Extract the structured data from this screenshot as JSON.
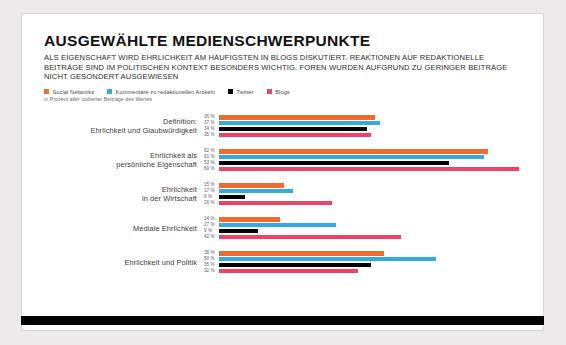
{
  "header": {
    "title": "AUSGEWÄHLTE MEDIENSCHWERPUNKTE",
    "subtitle": "ALS EIGENSCHAFT WIRD EHRLICHKEIT AM HÄUFIGSTEN IN BLOGS DISKUTIERT. REAKTIONEN AUF REDAKTIONELLE BEITRÄGE SIND IM POLITISCHEN KONTEXT BESONDERS WICHTIG. FOREN WURDEN AUFGRUND ZU GERINGER BEITRÄGE NICHT GESONDERT AUSGEWIESEN",
    "legend_note": "in Prozent aller codierter Beiträge des Wertes"
  },
  "colors": {
    "social_networks": "#EE6C2D",
    "kommentare": "#35AADC",
    "twitter": "#000000",
    "blogs": "#EE4266",
    "page_background": "#ECEAEA",
    "card_background": "#FFFFFF",
    "card_border": "#D8D6D6",
    "bottom_bar": "#000000",
    "title_text": "#111111",
    "label_text": "#3A3A3A",
    "value_text": "#5D5D5D"
  },
  "legend": [
    {
      "label": "Social Networks",
      "color": "#EE6C2D"
    },
    {
      "label": "Kommentare zu redaktionellen Artikeln",
      "color": "#35AADC"
    },
    {
      "label": "Twitter",
      "color": "#000000"
    },
    {
      "label": "Blogs",
      "color": "#EE4266"
    }
  ],
  "chart_data": {
    "type": "bar",
    "orientation": "horizontal",
    "grouped": true,
    "title": "AUSGEWÄHLTE MEDIENSCHWERPUNKTE",
    "subtitle": "ALS EIGENSCHAFT WIRD EHRLICHKEIT AM HÄUFIGSTEN IN BLOGS DISKUTIERT. REAKTIONEN AUF REDAKTIONELLE BEITRÄGE SIND IM POLITISCHEN KONTEXT BESONDERS WICHTIG. FOREN WURDEN AUFGRUND ZU GERINGER BEITRÄGE NICHT GESONDERT AUSGEWIESEN",
    "xlabel": "",
    "ylabel": "",
    "unit": "%",
    "value_note": "in Prozent aller codierter Beiträge des Wertes",
    "xlim": [
      0,
      70
    ],
    "grid": false,
    "legend_position": "top-left",
    "categories": [
      "Definition: Ehrlichkeit und Glaubwürdigkeit",
      "Ehrlichkeit als persönliche Eigenschaft",
      "Ehrlichkeit in der Wirtschaft",
      "Mediale Ehrlichkeit",
      "Ehrlichkeit und Politik"
    ],
    "series": [
      {
        "name": "Social Networks",
        "color": "#EE6C2D",
        "values": [
          36,
          62,
          15,
          14,
          38
        ]
      },
      {
        "name": "Kommentare zu redaktionellen Artikeln",
        "color": "#35AADC",
        "values": [
          37,
          61,
          17,
          27,
          50
        ]
      },
      {
        "name": "Twitter",
        "color": "#000000",
        "values": [
          34,
          53,
          6,
          9,
          35
        ]
      },
      {
        "name": "Blogs",
        "color": "#EE4266",
        "values": [
          35,
          69,
          26,
          42,
          32
        ]
      }
    ]
  },
  "groups": [
    {
      "label_line1": "Definition:",
      "label_line2": "Ehrlichkeit und Glaubwürdigkeit",
      "bars": [
        {
          "series": "Social Networks",
          "value": 36,
          "value_label": "36 %",
          "color": "#EE6C2D"
        },
        {
          "series": "Kommentare zu redaktionellen Artikeln",
          "value": 37,
          "value_label": "37 %",
          "color": "#35AADC"
        },
        {
          "series": "Twitter",
          "value": 34,
          "value_label": "34 %",
          "color": "#000000"
        },
        {
          "series": "Blogs",
          "value": 35,
          "value_label": "35 %",
          "color": "#EE4266"
        }
      ]
    },
    {
      "label_line1": "Ehrlichkeit als",
      "label_line2": "persönliche Eigenschaft",
      "bars": [
        {
          "series": "Social Networks",
          "value": 62,
          "value_label": "62 %",
          "color": "#EE6C2D"
        },
        {
          "series": "Kommentare zu redaktionellen Artikeln",
          "value": 61,
          "value_label": "61 %",
          "color": "#35AADC"
        },
        {
          "series": "Twitter",
          "value": 53,
          "value_label": "53 %",
          "color": "#000000"
        },
        {
          "series": "Blogs",
          "value": 69,
          "value_label": "69 %",
          "color": "#EE4266"
        }
      ]
    },
    {
      "label_line1": "Ehrlichkeit",
      "label_line2": "in der Wirtschaft",
      "bars": [
        {
          "series": "Social Networks",
          "value": 15,
          "value_label": "15 %",
          "color": "#EE6C2D"
        },
        {
          "series": "Kommentare zu redaktionellen Artikeln",
          "value": 17,
          "value_label": "17 %",
          "color": "#35AADC"
        },
        {
          "series": "Twitter",
          "value": 6,
          "value_label": "6 %",
          "color": "#000000"
        },
        {
          "series": "Blogs",
          "value": 26,
          "value_label": "26 %",
          "color": "#EE4266"
        }
      ]
    },
    {
      "label_line1": "Mediale Ehrlichkeit",
      "label_line2": "",
      "bars": [
        {
          "series": "Social Networks",
          "value": 14,
          "value_label": "14 %",
          "color": "#EE6C2D"
        },
        {
          "series": "Kommentare zu redaktionellen Artikeln",
          "value": 27,
          "value_label": "27 %",
          "color": "#35AADC"
        },
        {
          "series": "Twitter",
          "value": 9,
          "value_label": "9 %",
          "color": "#000000"
        },
        {
          "series": "Blogs",
          "value": 42,
          "value_label": "42 %",
          "color": "#EE4266"
        }
      ]
    },
    {
      "label_line1": "Ehrlichkeit und Politik",
      "label_line2": "",
      "bars": [
        {
          "series": "Social Networks",
          "value": 38,
          "value_label": "38 %",
          "color": "#EE6C2D"
        },
        {
          "series": "Kommentare zu redaktionellen Artikeln",
          "value": 50,
          "value_label": "50 %",
          "color": "#35AADC"
        },
        {
          "series": "Twitter",
          "value": 35,
          "value_label": "35 %",
          "color": "#000000"
        },
        {
          "series": "Blogs",
          "value": 32,
          "value_label": "32 %",
          "color": "#EE4266"
        }
      ]
    }
  ]
}
